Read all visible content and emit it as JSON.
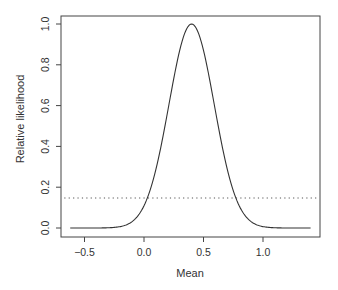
{
  "chart_data": {
    "type": "line",
    "title": "",
    "xlabel": "Mean",
    "ylabel": "Relative likelihood",
    "xlim": [
      -0.62,
      1.4
    ],
    "ylim": [
      0.0,
      1.0
    ],
    "x_ticks": [
      -0.5,
      0.0,
      0.5,
      1.0
    ],
    "x_tick_labels": [
      "−0.5",
      "0.0",
      "0.5",
      "1.0"
    ],
    "y_ticks": [
      0.0,
      0.2,
      0.4,
      0.6,
      0.8,
      1.0
    ],
    "y_tick_labels": [
      "0.0",
      "0.2",
      "0.4",
      "0.6",
      "0.8",
      "1.0"
    ],
    "grid": false,
    "legend": null,
    "series": [
      {
        "name": "relative likelihood",
        "style": "solid",
        "color": "#333333",
        "curve": "gaussian",
        "peak_x": 0.4,
        "sigma": 0.19,
        "x": [
          -0.62,
          -0.4,
          -0.2,
          0.0,
          0.1,
          0.2,
          0.3,
          0.4,
          0.5,
          0.6,
          0.7,
          0.8,
          1.0,
          1.2,
          1.4
        ],
        "values": [
          0.0,
          0.0,
          0.007,
          0.109,
          0.288,
          0.575,
          0.871,
          1.0,
          0.871,
          0.575,
          0.288,
          0.109,
          0.007,
          0.0,
          0.0
        ]
      },
      {
        "name": "95% cutoff",
        "style": "dotted",
        "color": "#555555",
        "x": [
          -0.67,
          1.45
        ],
        "values": [
          0.147,
          0.147
        ]
      }
    ]
  }
}
